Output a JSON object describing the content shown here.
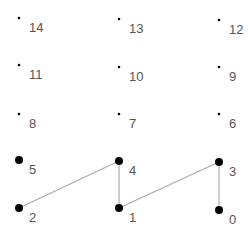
{
  "diagram": {
    "nodes": [
      {
        "id": "0",
        "label": "0",
        "x": 219,
        "y": 210,
        "size": "large"
      },
      {
        "id": "1",
        "label": "1",
        "x": 119,
        "y": 208,
        "size": "large"
      },
      {
        "id": "2",
        "label": "2",
        "x": 19,
        "y": 208,
        "size": "large"
      },
      {
        "id": "3",
        "label": "3",
        "x": 219,
        "y": 162,
        "size": "large"
      },
      {
        "id": "4",
        "label": "4",
        "x": 119,
        "y": 161,
        "size": "large"
      },
      {
        "id": "5",
        "label": "5",
        "x": 19,
        "y": 160,
        "size": "large"
      },
      {
        "id": "6",
        "label": "6",
        "x": 219,
        "y": 114,
        "size": "small"
      },
      {
        "id": "7",
        "label": "7",
        "x": 119,
        "y": 114,
        "size": "small"
      },
      {
        "id": "8",
        "label": "8",
        "x": 19,
        "y": 114,
        "size": "small"
      },
      {
        "id": "9",
        "label": "9",
        "x": 219,
        "y": 67,
        "size": "small"
      },
      {
        "id": "10",
        "label": "10",
        "x": 119,
        "y": 67,
        "size": "small"
      },
      {
        "id": "11",
        "label": "11",
        "x": 19,
        "y": 65,
        "size": "small"
      },
      {
        "id": "12",
        "label": "12",
        "x": 219,
        "y": 20,
        "size": "small"
      },
      {
        "id": "13",
        "label": "13",
        "x": 119,
        "y": 19,
        "size": "small"
      },
      {
        "id": "14",
        "label": "14",
        "x": 19,
        "y": 18,
        "size": "small"
      }
    ],
    "edges": [
      {
        "from": "2",
        "to": "4"
      },
      {
        "from": "4",
        "to": "1"
      },
      {
        "from": "1",
        "to": "3"
      },
      {
        "from": "3",
        "to": "0"
      }
    ],
    "colors": {
      "node": "#000000",
      "edge": "#aaaaaa",
      "label": "#555555"
    }
  }
}
